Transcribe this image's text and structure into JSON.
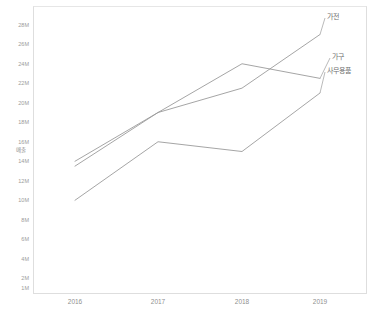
{
  "chart_data": {
    "type": "line",
    "title": "",
    "xlabel": "",
    "ylabel": "매출",
    "categories": [
      "2016",
      "2017",
      "2018",
      "2019"
    ],
    "x": [
      2016,
      2017,
      2018,
      2019
    ],
    "ylim": [
      0,
      28000000
    ],
    "ytick_step": 2000000,
    "grid": false,
    "legend_position": "direct-labels-right",
    "series": [
      {
        "name": "가전",
        "values": [
          14000000,
          19000000,
          21500000,
          27000000
        ],
        "color": "#9b9b9b"
      },
      {
        "name": "가구",
        "values": [
          13500000,
          19000000,
          24000000,
          22500000
        ],
        "color": "#9b9b9b"
      },
      {
        "name": "사무용품",
        "values": [
          10000000,
          16000000,
          15000000,
          21000000
        ],
        "color": "#9b9b9b"
      }
    ],
    "ytick_labels": [
      "28M",
      "26M",
      "24M",
      "22M",
      "20M",
      "18M",
      "16M",
      "14M",
      "12M",
      "10M",
      "8M",
      "6M",
      "4M",
      "2M",
      "1M"
    ],
    "xtick_labels": [
      "2016",
      "2017",
      "2018",
      "2019"
    ]
  },
  "axes": {
    "y_title": "매출"
  },
  "labels": {
    "series": [
      "가전",
      "가구",
      "사무용품"
    ]
  },
  "colors": {
    "line": "#9b9b9b",
    "border": "#dedede",
    "tick_text": "#9a9a9a",
    "label_text": "#6f6f6f",
    "background": "#ffffff"
  }
}
